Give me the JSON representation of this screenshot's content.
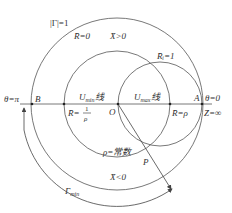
{
  "diagram": {
    "labels": {
      "gamma_unit": "|Γ|=1",
      "r_zero": "R̄=0",
      "x_pos": "X̄>0",
      "r_one": "R̄ᵢ=1",
      "theta_pi": "θ=π",
      "point_b": "B",
      "u_min": "U",
      "u_min_sub": "min",
      "u_min_suffix": "线",
      "u_max": "U",
      "u_max_sub": "max",
      "u_max_suffix": "线",
      "point_a": "A",
      "theta_zero": "θ=0",
      "r_inv_rho": "R̄=",
      "r_inv_num": "1",
      "r_inv_den": "ρ",
      "point_o": "O",
      "r_rho": "R̄=ρ",
      "z_inf": "Z̄=∞",
      "rho_const": "ρ=常数",
      "point_p": "P",
      "x_neg": "X̄<0",
      "gamma_min": "Γ",
      "gamma_min_sub": "min"
    }
  }
}
